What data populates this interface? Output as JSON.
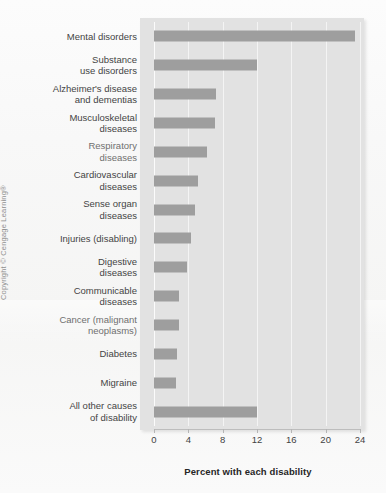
{
  "figure": {
    "x_axis_title": "Percent with each disability",
    "copyright": "Copyright © Cengage Learning®",
    "colors": {
      "bar": "#9e9e9e",
      "panel": "#e2e2e2",
      "gridline": "#f4f4f4",
      "axis": "#bdbdbd",
      "text": "#3a3a3a"
    }
  },
  "chart_data": {
    "type": "bar",
    "orientation": "horizontal",
    "title": "",
    "subtitle": "",
    "xlabel": "Percent with each disability",
    "ylabel": "",
    "xlim": [
      0,
      24
    ],
    "xticks": [
      0,
      4,
      8,
      12,
      16,
      20,
      24
    ],
    "xtick_labels": [
      "0",
      "4",
      "8",
      "12",
      "16",
      "20",
      "24"
    ],
    "grid": true,
    "grid_axis": "x",
    "legend": false,
    "legend_position": "none",
    "categories": [
      "Mental disorders",
      "Substance\nuse disorders",
      "Alzheimer's disease\nand dementias",
      "Musculoskeletal\ndiseases",
      "Respiratory\ndiseases",
      "Cardiovascular\ndiseases",
      "Sense organ\ndiseases",
      "Injuries (disabling)",
      "Digestive\ndiseases",
      "Communicable\ndiseases",
      "Cancer (malignant\nneoplasms)",
      "Diabetes",
      "Migraine",
      "All other causes\nof disability"
    ],
    "values": [
      23.4,
      12.0,
      7.2,
      7.1,
      6.2,
      5.1,
      4.8,
      4.3,
      3.9,
      2.9,
      2.9,
      2.7,
      2.6,
      12.0
    ],
    "value_labels": [
      "",
      "",
      "",
      "",
      "",
      "",
      "",
      "",
      "",
      "",
      "",
      "",
      "",
      ""
    ],
    "annotations": []
  }
}
